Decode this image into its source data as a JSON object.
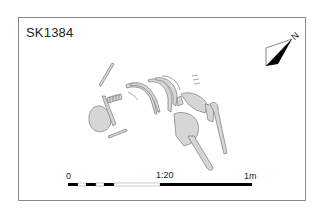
{
  "plan": {
    "title": "SK1384",
    "north_label": "N",
    "subject": "Skeleton burial plan"
  },
  "scale_bar": {
    "start_label": "0",
    "ratio_label": "1:20",
    "end_label": "1m",
    "segments": [
      "black",
      "white",
      "black",
      "white",
      "black",
      "white",
      "black"
    ]
  },
  "colors": {
    "bone_fill": "#d6d6d6",
    "bone_stroke": "#7a7a7a",
    "frame": "#8a8a8a",
    "ink": "#000000"
  }
}
